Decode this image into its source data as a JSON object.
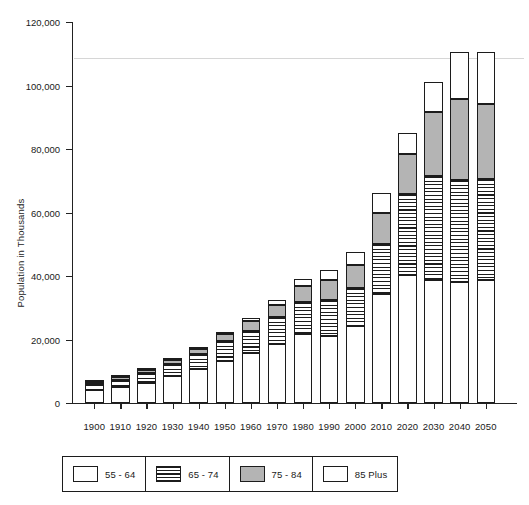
{
  "chart_data": {
    "type": "bar",
    "stacked": true,
    "title": "",
    "xlabel": "",
    "ylabel": "Population in Thousands",
    "ylim": [
      0,
      120000
    ],
    "ytick_labels": [
      "0",
      "20,000",
      "40,000",
      "60,000",
      "80,000",
      "100,000",
      "120,000"
    ],
    "ytick_values": [
      0,
      20000,
      40000,
      60000,
      80000,
      100000,
      120000
    ],
    "grid": false,
    "legend_position": "bottom",
    "categories": [
      "1900",
      "1910",
      "1920",
      "1930",
      "1940",
      "1950",
      "1960",
      "1970",
      "1980",
      "1990",
      "2000",
      "2010",
      "2020",
      "2030",
      "2040",
      "2050"
    ],
    "series": [
      {
        "name": "55 - 64",
        "pattern": "white",
        "values": [
          4000,
          5000,
          6300,
          8400,
          10600,
          13300,
          15600,
          18700,
          21700,
          21100,
          24300,
          34300,
          40300,
          38700,
          38000,
          38800
        ]
      },
      {
        "name": "65 - 74",
        "pattern": "horizontal-stripes",
        "values": [
          2000,
          2400,
          3000,
          3800,
          4700,
          6100,
          7200,
          8400,
          10100,
          11300,
          12000,
          15800,
          25500,
          32700,
          32300,
          31800
        ]
      },
      {
        "name": "75 - 84",
        "pattern": "gray",
        "values": [
          700,
          900,
          1100,
          1500,
          1800,
          2300,
          3000,
          3900,
          5000,
          6500,
          7100,
          9800,
          12500,
          20200,
          25400,
          23600
        ]
      },
      {
        "name": "85 Plus",
        "pattern": "white",
        "values": [
          200,
          200,
          300,
          400,
          500,
          700,
          900,
          1400,
          2200,
          3100,
          4200,
          6100,
          6800,
          9400,
          15000,
          16300
        ]
      }
    ],
    "totals": [
      6900,
      8500,
      10700,
      14100,
      17600,
      22400,
      26700,
      32400,
      39000,
      42000,
      47600,
      66000,
      85100,
      101000,
      110700,
      110500
    ]
  },
  "legend": {
    "items": [
      {
        "label": "55 - 64",
        "pattern": "white"
      },
      {
        "label": "65 - 74",
        "pattern": "hatch"
      },
      {
        "label": "75 - 84",
        "pattern": "gray"
      },
      {
        "label": "85 Plus",
        "pattern": "white"
      }
    ]
  },
  "colors": {
    "ink": "#1c1c1c",
    "gray_fill": "#b4b4b4",
    "white_fill": "#ffffff",
    "background": "#ffffff"
  }
}
